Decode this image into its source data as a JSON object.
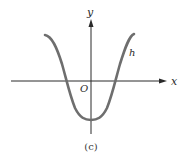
{
  "figure": {
    "caption": "(c)",
    "axes": {
      "x_label": "x",
      "y_label": "y",
      "origin_label": "O"
    },
    "curve": {
      "label": "h",
      "color": "#6e6e6e"
    },
    "axis_color": "#2a2a2a"
  }
}
